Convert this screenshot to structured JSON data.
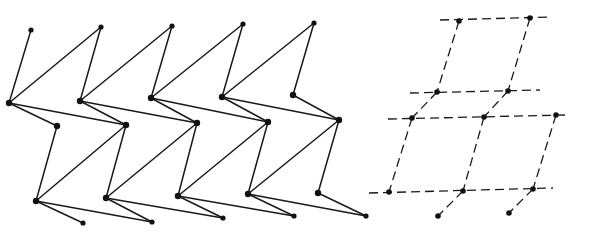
{
  "figure": {
    "width": 589,
    "height": 238,
    "colors": {
      "line": "#1a1a1a",
      "node": "#111111",
      "background": "#ffffff"
    }
  },
  "left_structure": {
    "name": "zigzag-chain-network",
    "line_style": "solid",
    "nodes": {
      "top": [
        [
          31,
          30
        ],
        [
          101,
          27
        ],
        [
          172,
          26
        ],
        [
          243,
          24
        ],
        [
          314,
          23
        ]
      ],
      "r2": [
        [
          9,
          103
        ],
        [
          80,
          101
        ],
        [
          151,
          98
        ],
        [
          222,
          97
        ],
        [
          293,
          95
        ]
      ],
      "r3": [
        [
          57,
          126
        ],
        [
          126,
          125
        ],
        [
          197,
          123
        ],
        [
          268,
          122
        ],
        [
          339,
          120
        ]
      ],
      "r4": [
        [
          36,
          201
        ],
        [
          106,
          198
        ],
        [
          178,
          196
        ],
        [
          248,
          194
        ],
        [
          318,
          193
        ]
      ],
      "r5": [
        [
          83,
          223
        ],
        [
          152,
          222
        ],
        [
          223,
          218
        ],
        [
          294,
          216
        ],
        [
          366,
          216
        ]
      ]
    }
  },
  "right_structure": {
    "name": "dashed-lattice-projection",
    "line_style": "dashed",
    "nodes": [
      [
        459,
        21
      ],
      [
        530,
        18
      ],
      [
        437,
        92
      ],
      [
        508,
        91
      ],
      [
        412,
        118
      ],
      [
        484,
        117
      ],
      [
        556,
        115
      ],
      [
        389,
        192
      ],
      [
        463,
        191
      ],
      [
        533,
        189
      ],
      [
        438,
        216
      ],
      [
        509,
        213
      ]
    ],
    "horizontal_lines": [
      [
        440,
        20,
        551,
        17
      ],
      [
        410,
        93,
        540,
        90
      ],
      [
        388,
        119,
        565,
        115
      ],
      [
        369,
        193,
        553,
        188
      ]
    ],
    "bonds": [
      [
        0,
        2
      ],
      [
        2,
        4
      ],
      [
        4,
        7
      ],
      [
        1,
        3
      ],
      [
        3,
        5
      ],
      [
        5,
        8
      ],
      [
        8,
        10
      ],
      [
        6,
        9
      ],
      [
        9,
        11
      ]
    ]
  }
}
